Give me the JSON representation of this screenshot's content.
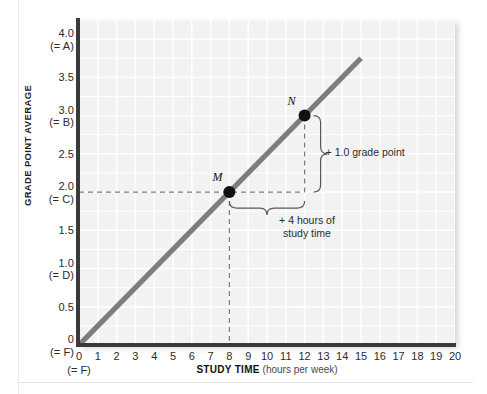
{
  "chart_data": {
    "type": "line",
    "title": "",
    "xlabel": "STUDY TIME (hours per week)",
    "ylabel": "GRADE POINT AVERAGE",
    "xlim": [
      0,
      20
    ],
    "ylim": [
      0,
      4.25
    ],
    "grid": true,
    "legend": "none",
    "series": [
      {
        "name": "GPA vs study time",
        "x": [
          0,
          15
        ],
        "y": [
          0,
          3.75
        ],
        "slope": 0.25,
        "intercept": 0,
        "color": "#7d7d7d"
      }
    ],
    "points": [
      {
        "label": "M",
        "x": 8,
        "y": 2.0
      },
      {
        "label": "N",
        "x": 12,
        "y": 3.0
      }
    ],
    "annotations": [
      {
        "name": "rise",
        "text": "+ 1.0 grade point"
      },
      {
        "name": "run-line1",
        "text": "+ 4 hours of"
      },
      {
        "name": "run-line2",
        "text": "study time"
      }
    ],
    "x_ticks": [
      "0",
      "1",
      "2",
      "3",
      "4",
      "5",
      "6",
      "7",
      "8",
      "9",
      "10",
      "11",
      "12",
      "13",
      "14",
      "15",
      "16",
      "17",
      "18",
      "19",
      "20"
    ],
    "x_tick_sub": {
      "0": "(= F)"
    },
    "y_ticks": [
      {
        "value": 4.0,
        "label": "4.0",
        "sub": "(= A)"
      },
      {
        "value": 3.5,
        "label": "3.5",
        "sub": ""
      },
      {
        "value": 3.0,
        "label": "3.0",
        "sub": "(= B)"
      },
      {
        "value": 2.5,
        "label": "2.5",
        "sub": ""
      },
      {
        "value": 2.0,
        "label": "2.0",
        "sub": "(= C)"
      },
      {
        "value": 1.5,
        "label": "1.5",
        "sub": ""
      },
      {
        "value": 1.0,
        "label": "1.0",
        "sub": "(= D)"
      },
      {
        "value": 0.5,
        "label": "0.5",
        "sub": ""
      },
      {
        "value": 0.0,
        "label": "0",
        "sub": "(= F)"
      }
    ],
    "colors": {
      "plot_background": "#f2f2f2",
      "gridline": "#ffffff",
      "axis": "#3a3a3a",
      "line": "#7d7d7d",
      "marker": "#111111",
      "dashed_guide": "#7a7a7a",
      "text": "#2b2b2b"
    }
  }
}
